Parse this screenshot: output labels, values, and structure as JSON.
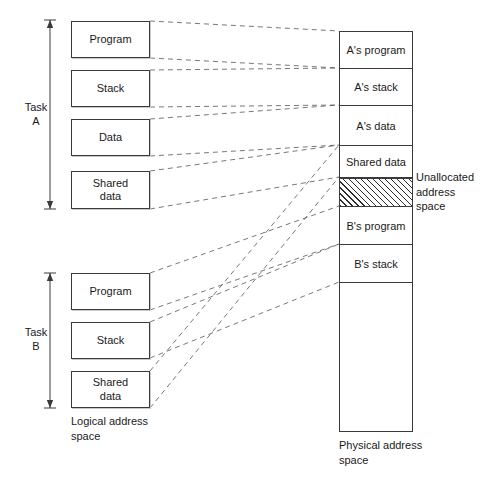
{
  "figure": {
    "colors": {
      "line": "#3a3a3a",
      "dash": "#555555",
      "text": "#1a1a1a",
      "background": "#ffffff",
      "shadow": "#c9c9c9"
    }
  },
  "tasks": [
    {
      "id": "task-a",
      "label": "Task\nA",
      "bracket": {
        "x": 50,
        "y_top": 20,
        "y_bottom": 209
      },
      "segments": [
        {
          "id": "a-program",
          "label": "Program",
          "x": 71,
          "y": 21,
          "w": 79,
          "h": 37
        },
        {
          "id": "a-stack",
          "label": "Stack",
          "x": 71,
          "y": 70,
          "w": 79,
          "h": 37
        },
        {
          "id": "a-data",
          "label": "Data",
          "x": 71,
          "y": 119,
          "w": 79,
          "h": 37
        },
        {
          "id": "a-shared-data",
          "label": "Shared\ndata",
          "x": 71,
          "y": 171,
          "w": 79,
          "h": 38
        }
      ]
    },
    {
      "id": "task-b",
      "label": "Task\nB",
      "bracket": {
        "x": 50,
        "y_top": 273,
        "y_bottom": 408
      },
      "segments": [
        {
          "id": "b-program",
          "label": "Program",
          "x": 71,
          "y": 273,
          "w": 79,
          "h": 37
        },
        {
          "id": "b-stack",
          "label": "Stack",
          "x": 71,
          "y": 322,
          "w": 79,
          "h": 37
        },
        {
          "id": "b-shared-data",
          "label": "Shared\ndata",
          "x": 71,
          "y": 371,
          "w": 79,
          "h": 37
        }
      ]
    }
  ],
  "logical_caption": "Logical address\nspace",
  "physical": {
    "caption": "Physical address\nspace",
    "box": {
      "x": 339,
      "y": 31,
      "w": 74,
      "h": 401
    },
    "segments": [
      {
        "id": "phys-a-program",
        "label": "A's program",
        "top": 0,
        "height": 37,
        "hatched": false
      },
      {
        "id": "phys-a-stack",
        "label": "A's stack",
        "top": 37,
        "height": 37,
        "hatched": false
      },
      {
        "id": "phys-a-data",
        "label": "A's data",
        "top": 74,
        "height": 40,
        "hatched": false
      },
      {
        "id": "phys-shared-data",
        "label": "Shared data",
        "top": 114,
        "height": 32,
        "hatched": false
      },
      {
        "id": "phys-unallocated",
        "label": "",
        "top": 146,
        "height": 29,
        "hatched": true
      },
      {
        "id": "phys-b-program",
        "label": "B's program",
        "top": 175,
        "height": 38,
        "hatched": false
      },
      {
        "id": "phys-b-stack",
        "label": "B's stack",
        "top": 213,
        "height": 38,
        "hatched": false
      },
      {
        "id": "phys-free",
        "label": "",
        "top": 251,
        "height": 150,
        "hatched": false
      }
    ]
  },
  "annotations": [
    {
      "id": "unallocated-note",
      "text": "Unallocated\naddress\nspace",
      "x": 416,
      "y": 170
    }
  ],
  "connectors": [
    {
      "id": "wire-a-program-top",
      "x1": 150,
      "y1": 21,
      "x2": 339,
      "y2": 31
    },
    {
      "id": "wire-a-program-bottom",
      "x1": 150,
      "y1": 58,
      "x2": 339,
      "y2": 68
    },
    {
      "id": "wire-a-stack-top",
      "x1": 150,
      "y1": 70,
      "x2": 339,
      "y2": 68
    },
    {
      "id": "wire-a-stack-bottom",
      "x1": 150,
      "y1": 107,
      "x2": 339,
      "y2": 105
    },
    {
      "id": "wire-a-data-top",
      "x1": 150,
      "y1": 119,
      "x2": 339,
      "y2": 105
    },
    {
      "id": "wire-a-data-bottom",
      "x1": 150,
      "y1": 156,
      "x2": 339,
      "y2": 145
    },
    {
      "id": "wire-a-shared-top",
      "x1": 150,
      "y1": 171,
      "x2": 339,
      "y2": 145
    },
    {
      "id": "wire-a-shared-bottom",
      "x1": 150,
      "y1": 209,
      "x2": 339,
      "y2": 177
    },
    {
      "id": "wire-b-program-top",
      "x1": 150,
      "y1": 273,
      "x2": 339,
      "y2": 206
    },
    {
      "id": "wire-b-program-bottom",
      "x1": 150,
      "y1": 310,
      "x2": 339,
      "y2": 244
    },
    {
      "id": "wire-b-stack-top",
      "x1": 150,
      "y1": 322,
      "x2": 339,
      "y2": 244
    },
    {
      "id": "wire-b-stack-bottom",
      "x1": 150,
      "y1": 358,
      "x2": 339,
      "y2": 282
    },
    {
      "id": "wire-b-shared-top",
      "x1": 150,
      "y1": 371,
      "x2": 339,
      "y2": 145
    },
    {
      "id": "wire-b-shared-bottom",
      "x1": 150,
      "y1": 408,
      "x2": 339,
      "y2": 177
    }
  ]
}
